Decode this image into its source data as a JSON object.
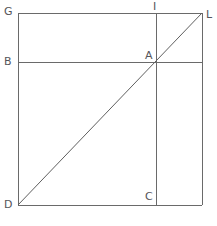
{
  "figure": {
    "background_color": "#ffffff",
    "stroke_color": "#6a6a6a",
    "label_color": "#55555a",
    "stroke_width": 1,
    "labels": {
      "G": "G",
      "I": "I",
      "L": "L",
      "B": "B",
      "A": "A",
      "D": "D",
      "C": "C"
    },
    "points": {
      "G": {
        "x": 18,
        "y": 13
      },
      "L": {
        "x": 202,
        "y": 13
      },
      "D": {
        "x": 18,
        "y": 205
      },
      "R": {
        "x": 202,
        "y": 205
      },
      "I": {
        "x": 156,
        "y": 13
      },
      "C": {
        "x": 156,
        "y": 205
      },
      "B": {
        "x": 18,
        "y": 62
      },
      "A": {
        "x": 156,
        "y": 62
      },
      "E": {
        "x": 202,
        "y": 62
      }
    },
    "segments": [
      {
        "name": "square-top-edge",
        "from": "G",
        "to": "L"
      },
      {
        "name": "square-left-edge",
        "from": "G",
        "to": "D"
      },
      {
        "name": "square-right-edge",
        "from": "L",
        "to": "R"
      },
      {
        "name": "square-bottom-edge",
        "from": "D",
        "to": "R"
      },
      {
        "name": "diagonal-D-to-L",
        "from": "D",
        "to": "L"
      },
      {
        "name": "vertical-chord-I-to-C",
        "from": "I",
        "to": "C"
      },
      {
        "name": "horizontal-chord-B-to-E",
        "from": "B",
        "to": "E"
      }
    ]
  }
}
